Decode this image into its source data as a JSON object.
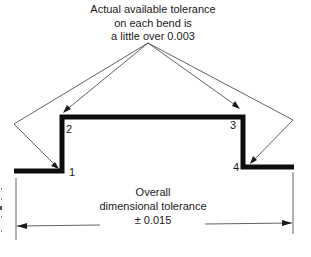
{
  "annotation_top": {
    "lines": [
      "Actual available tolerance",
      "on each bend is",
      "a little over 0.003"
    ]
  },
  "bends": [
    {
      "id": "1",
      "label": "1"
    },
    {
      "id": "2",
      "label": "2"
    },
    {
      "id": "3",
      "label": "3"
    },
    {
      "id": "4",
      "label": "4"
    }
  ],
  "annotation_bottom": {
    "lines": [
      "Overall",
      "dimensional tolerance",
      "± 0.015"
    ]
  },
  "colors": {
    "profile": "#0d0d0d",
    "leader": "#3a3a3a",
    "text": "#1a1a1a",
    "background": "#ffffff"
  }
}
